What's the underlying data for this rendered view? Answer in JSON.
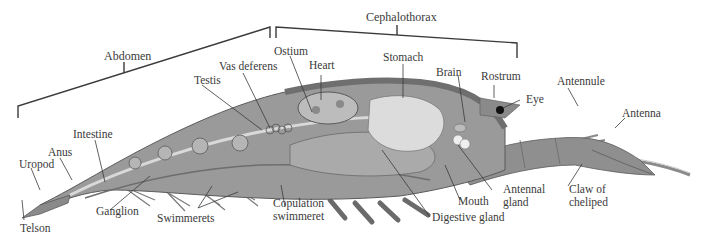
{
  "diagram": {
    "regions": [
      {
        "id": "abdomen",
        "label": "Abdomen"
      },
      {
        "id": "cephalothorax",
        "label": "Cephalothorax"
      }
    ],
    "labels": {
      "abdomen": "Abdomen",
      "cephalothorax": "Cephalothorax",
      "ostium": "Ostium",
      "heart": "Heart",
      "vas_deferens": "Vas deferens",
      "testis": "Testis",
      "stomach": "Stomach",
      "brain": "Brain",
      "rostrum": "Rostrum",
      "eye": "Eye",
      "antennule": "Antennule",
      "antenna": "Antenna",
      "intestine": "Intestine",
      "anus": "Anus",
      "uropod": "Uropod",
      "telson": "Telson",
      "ganglion": "Ganglion",
      "swimmerets": "Swimmerets",
      "copulation_swimmeret_1": "Copulation",
      "copulation_swimmeret_2": "swimmeret",
      "digestive_gland": "Digestive gland",
      "mouth": "Mouth",
      "antennal_gland_1": "Antennal",
      "antennal_gland_2": "gland",
      "claw_of_cheliped_1": "Claw of",
      "claw_of_cheliped_2": "cheliped"
    },
    "colors": {
      "line": "#3a3a3a",
      "body_dark": "#7d7d7d",
      "body_mid": "#9a9a9a",
      "body_light": "#bcbcbc",
      "organ_light": "#d6d6d6",
      "stomach": "#dcdcdc"
    }
  }
}
